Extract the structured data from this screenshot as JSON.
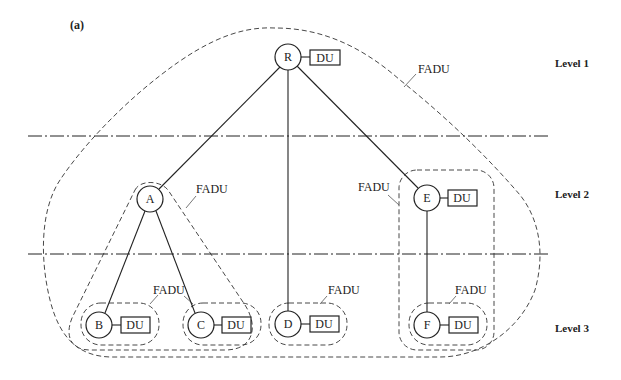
{
  "panel_label": "(a)",
  "levels": [
    {
      "label": "Level 1"
    },
    {
      "label": "Level 2"
    },
    {
      "label": "Level 3"
    }
  ],
  "nodes": {
    "R": {
      "label": "R",
      "du": "DU"
    },
    "A": {
      "label": "A"
    },
    "E": {
      "label": "E",
      "du": "DU"
    },
    "B": {
      "label": "B",
      "du": "DU"
    },
    "C": {
      "label": "C",
      "du": "DU"
    },
    "D": {
      "label": "D",
      "du": "DU"
    },
    "F": {
      "label": "F",
      "du": "DU"
    }
  },
  "fadu_labels": {
    "root": "FADU",
    "a_group": "FADU",
    "e_group": "FADU",
    "bc_group": "FADU",
    "d_group": "FADU",
    "f_group": "FADU"
  },
  "edges": [
    [
      "R",
      "A"
    ],
    [
      "R",
      "D"
    ],
    [
      "R",
      "E"
    ],
    [
      "A",
      "B"
    ],
    [
      "A",
      "C"
    ],
    [
      "E",
      "F"
    ]
  ]
}
